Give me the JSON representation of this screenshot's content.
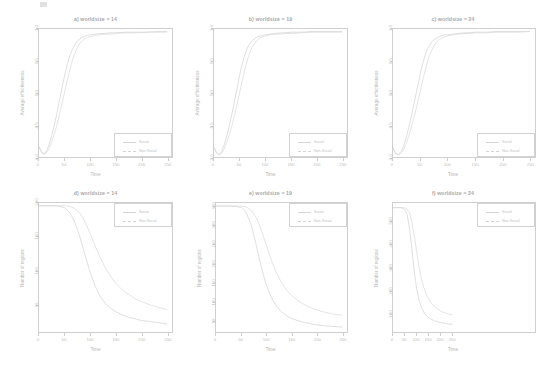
{
  "figure": {
    "layout": "2 rows x 3 columns",
    "colors": {
      "curve_primary": "#d0d0d0",
      "curve_secondary": "#d8d8d8",
      "axis": "#cdcdcd",
      "text": "#b9b9b9"
    }
  },
  "legend": {
    "entries": [
      {
        "label": "Social",
        "style": "solid"
      },
      {
        "label": "Non-Social",
        "style": "dashed"
      }
    ]
  },
  "chart_data": [
    {
      "id": "a",
      "type": "line",
      "title": "a) worldsize = 14",
      "xlabel": "Time",
      "ylabel": "Average effectiveness",
      "xlim": [
        0,
        260
      ],
      "ylim": [
        -1.0,
        1.0
      ],
      "xticks": [
        0,
        50,
        100,
        150,
        200,
        250
      ],
      "yticks": [
        -1.0,
        -0.5,
        0.0,
        0.5,
        1.0
      ],
      "ytick_labels": [
        "-1.0",
        "-0.5",
        "0.0",
        "0.5",
        "1.0"
      ],
      "grid": false,
      "legend_position": "bottom-right",
      "x": [
        0,
        5,
        10,
        15,
        20,
        25,
        30,
        35,
        40,
        45,
        50,
        55,
        60,
        65,
        70,
        75,
        80,
        85,
        90,
        95,
        100,
        110,
        120,
        130,
        140,
        150,
        170,
        190,
        210,
        230,
        250
      ],
      "series": [
        {
          "name": "Social",
          "values": [
            -0.84,
            -0.92,
            -0.95,
            -0.9,
            -0.8,
            -0.66,
            -0.5,
            -0.32,
            -0.12,
            0.08,
            0.27,
            0.44,
            0.58,
            0.68,
            0.76,
            0.81,
            0.85,
            0.87,
            0.89,
            0.9,
            0.91,
            0.92,
            0.93,
            0.93,
            0.94,
            0.94,
            0.95,
            0.95,
            0.95,
            0.96,
            0.96
          ]
        },
        {
          "name": "Non-Social",
          "values": [
            -0.84,
            -0.93,
            -0.96,
            -0.93,
            -0.86,
            -0.76,
            -0.64,
            -0.5,
            -0.34,
            -0.17,
            0.01,
            0.19,
            0.36,
            0.5,
            0.62,
            0.71,
            0.78,
            0.82,
            0.85,
            0.87,
            0.88,
            0.9,
            0.91,
            0.92,
            0.92,
            0.93,
            0.94,
            0.94,
            0.95,
            0.95,
            0.95
          ]
        }
      ]
    },
    {
      "id": "b",
      "type": "line",
      "title": "b) worldsize = 19",
      "xlabel": "Time",
      "ylabel": "Average effectiveness",
      "xlim": [
        0,
        260
      ],
      "ylim": [
        -1.0,
        1.0
      ],
      "xticks": [
        0,
        50,
        100,
        150,
        200,
        250
      ],
      "yticks": [
        -1.0,
        -0.5,
        0.0,
        0.5,
        1.0
      ],
      "ytick_labels": [
        "-1.0",
        "-0.5",
        "0.0",
        "0.5",
        "1.0"
      ],
      "grid": false,
      "legend_position": "bottom-right",
      "x": [
        0,
        5,
        10,
        15,
        20,
        25,
        30,
        35,
        40,
        45,
        50,
        55,
        60,
        65,
        70,
        75,
        80,
        85,
        90,
        95,
        100,
        110,
        120,
        130,
        140,
        150,
        170,
        190,
        210,
        230,
        250
      ],
      "series": [
        {
          "name": "Social",
          "values": [
            -0.85,
            -0.93,
            -0.96,
            -0.91,
            -0.81,
            -0.67,
            -0.51,
            -0.33,
            -0.13,
            0.07,
            0.27,
            0.45,
            0.59,
            0.7,
            0.77,
            0.82,
            0.85,
            0.88,
            0.89,
            0.9,
            0.91,
            0.92,
            0.93,
            0.94,
            0.94,
            0.95,
            0.95,
            0.96,
            0.96,
            0.96,
            0.96
          ]
        },
        {
          "name": "Non-Social",
          "values": [
            -0.85,
            -0.94,
            -0.97,
            -0.94,
            -0.87,
            -0.77,
            -0.65,
            -0.51,
            -0.35,
            -0.18,
            0.0,
            0.18,
            0.36,
            0.51,
            0.63,
            0.72,
            0.78,
            0.83,
            0.86,
            0.88,
            0.89,
            0.91,
            0.92,
            0.92,
            0.93,
            0.93,
            0.94,
            0.95,
            0.95,
            0.95,
            0.95
          ]
        }
      ]
    },
    {
      "id": "c",
      "type": "line",
      "title": "c) worldsize = 24",
      "xlabel": "Time",
      "ylabel": "Average effectiveness",
      "xlim": [
        0,
        260
      ],
      "ylim": [
        -1.0,
        1.0
      ],
      "xticks": [
        0,
        50,
        100,
        150,
        200,
        250
      ],
      "yticks": [
        -1.0,
        -0.5,
        0.0,
        0.5,
        1.0
      ],
      "ytick_labels": [
        "-1.0",
        "-0.5",
        "0.0",
        "0.5",
        "1.0"
      ],
      "grid": false,
      "legend_position": "bottom-right",
      "x": [
        0,
        5,
        10,
        15,
        20,
        25,
        30,
        35,
        40,
        45,
        50,
        55,
        60,
        65,
        70,
        75,
        80,
        85,
        90,
        95,
        100,
        110,
        120,
        130,
        140,
        150,
        170,
        190,
        210,
        230,
        250
      ],
      "series": [
        {
          "name": "Social",
          "values": [
            -0.86,
            -0.94,
            -0.96,
            -0.91,
            -0.81,
            -0.67,
            -0.5,
            -0.31,
            -0.11,
            0.1,
            0.3,
            0.48,
            0.62,
            0.72,
            0.79,
            0.83,
            0.86,
            0.88,
            0.9,
            0.91,
            0.91,
            0.92,
            0.93,
            0.94,
            0.94,
            0.95,
            0.95,
            0.96,
            0.96,
            0.96,
            0.96
          ]
        },
        {
          "name": "Non-Social",
          "values": [
            -0.86,
            -0.95,
            -0.97,
            -0.94,
            -0.87,
            -0.77,
            -0.64,
            -0.49,
            -0.33,
            -0.15,
            0.03,
            0.22,
            0.39,
            0.54,
            0.65,
            0.74,
            0.8,
            0.84,
            0.86,
            0.88,
            0.89,
            0.91,
            0.92,
            0.93,
            0.93,
            0.94,
            0.94,
            0.95,
            0.95,
            0.95,
            0.96
          ]
        }
      ]
    },
    {
      "id": "d",
      "type": "line",
      "title": "d) worldsize = 14",
      "xlabel": "Time",
      "ylabel": "Number of regions",
      "xlim": [
        0,
        260
      ],
      "ylim": [
        10,
        200
      ],
      "xticks": [
        0,
        50,
        100,
        150,
        200,
        250
      ],
      "yticks": [
        50,
        100,
        150,
        200
      ],
      "ytick_labels": [
        "50",
        "100",
        "150",
        "200"
      ],
      "grid": false,
      "legend_position": "top-right",
      "x": [
        0,
        10,
        20,
        30,
        40,
        50,
        60,
        70,
        80,
        90,
        100,
        110,
        120,
        130,
        140,
        150,
        160,
        170,
        180,
        190,
        200,
        210,
        220,
        230,
        240,
        250
      ],
      "series": [
        {
          "name": "Social",
          "values": [
            196,
            196,
            196,
            196,
            195,
            193,
            186,
            172,
            150,
            123,
            98,
            77,
            62,
            52,
            45,
            40,
            36,
            33,
            31,
            29,
            27,
            26,
            25,
            24,
            23,
            22
          ]
        },
        {
          "name": "Non-Social",
          "values": [
            196,
            196,
            196,
            196,
            196,
            196,
            195,
            192,
            185,
            172,
            155,
            136,
            119,
            104,
            92,
            82,
            74,
            68,
            63,
            58,
            55,
            52,
            49,
            47,
            45,
            43
          ]
        }
      ]
    },
    {
      "id": "e",
      "type": "line",
      "title": "e) worldsize = 19",
      "xlabel": "Time",
      "ylabel": "Number of regions",
      "xlim": [
        0,
        260
      ],
      "ylim": [
        20,
        360
      ],
      "xticks": [
        0,
        50,
        100,
        150,
        200,
        250
      ],
      "yticks": [
        50,
        100,
        150,
        200,
        250,
        300,
        350
      ],
      "ytick_labels": [
        "50",
        "100",
        "150",
        "200",
        "250",
        "300",
        "350"
      ],
      "grid": false,
      "legend_position": "top-right",
      "x": [
        0,
        10,
        20,
        30,
        40,
        50,
        60,
        70,
        80,
        90,
        100,
        110,
        120,
        130,
        140,
        150,
        160,
        170,
        180,
        190,
        200,
        210,
        220,
        230,
        240,
        250
      ],
      "series": [
        {
          "name": "Social",
          "values": [
            352,
            352,
            352,
            352,
            351,
            348,
            335,
            302,
            248,
            190,
            143,
            110,
            88,
            73,
            63,
            56,
            51,
            47,
            44,
            41,
            39,
            37,
            36,
            35,
            34,
            33
          ]
        },
        {
          "name": "Non-Social",
          "values": [
            352,
            352,
            352,
            352,
            352,
            352,
            350,
            341,
            321,
            288,
            248,
            209,
            176,
            150,
            131,
            116,
            105,
            96,
            89,
            83,
            78,
            74,
            71,
            68,
            66,
            64
          ]
        }
      ]
    },
    {
      "id": "f",
      "type": "line",
      "title": "f) worldsize = 24",
      "xlabel": "Time",
      "ylabel": "Number of regions",
      "xlim": [
        0,
        600
      ],
      "ylim": [
        20,
        580
      ],
      "xticks": [
        0,
        50,
        100,
        150,
        200,
        250
      ],
      "yticks": [
        100,
        200,
        300,
        400,
        500
      ],
      "ytick_labels": [
        "100",
        "200",
        "300",
        "400",
        "500"
      ],
      "grid": false,
      "legend_position": "top-right",
      "x": [
        0,
        10,
        20,
        30,
        40,
        50,
        60,
        70,
        80,
        90,
        100,
        110,
        120,
        130,
        140,
        150,
        160,
        170,
        180,
        190,
        200,
        210,
        220,
        230,
        240,
        250
      ],
      "series": [
        {
          "name": "Social",
          "values": [
            560,
            560,
            560,
            560,
            558,
            552,
            528,
            468,
            378,
            284,
            208,
            158,
            126,
            106,
            92,
            83,
            76,
            71,
            67,
            64,
            61,
            59,
            57,
            55,
            54,
            53
          ]
        },
        {
          "name": "Non-Social",
          "values": [
            560,
            560,
            560,
            560,
            560,
            559,
            554,
            537,
            498,
            437,
            368,
            304,
            252,
            213,
            185,
            164,
            148,
            136,
            126,
            118,
            112,
            107,
            103,
            100,
            97,
            95
          ]
        }
      ]
    }
  ]
}
